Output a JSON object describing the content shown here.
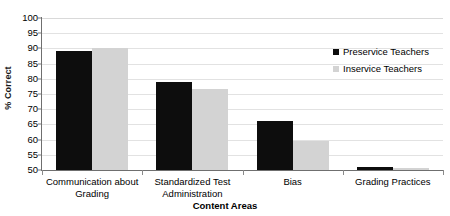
{
  "chart_data": {
    "type": "bar",
    "title": "",
    "xlabel": "Content Areas",
    "ylabel": "% Correct",
    "ylim": [
      50,
      100
    ],
    "ytick_step": 5,
    "yticks": [
      100,
      95,
      90,
      85,
      80,
      75,
      70,
      65,
      60,
      55,
      50
    ],
    "grid": true,
    "legend_position": "inside-top-right",
    "categories": [
      "Communication about Grading",
      "Standardized Test Administration",
      "Bias",
      "Grading Practices"
    ],
    "series": [
      {
        "name": "Preservice Teachers",
        "color": "#0d0d0d",
        "values": [
          89,
          79,
          66,
          51
        ]
      },
      {
        "name": "Inservice Teachers",
        "color": "#d3d3d3",
        "values": [
          90,
          76.5,
          59.5,
          50.8
        ]
      }
    ]
  },
  "legend": {
    "items": [
      {
        "label": "Preservice Teachers",
        "swatch": "black-square-icon"
      },
      {
        "label": "Inservice Teachers",
        "swatch": "gray-square-icon"
      }
    ]
  },
  "axes": {
    "y_title": "% Correct",
    "x_title": "Content Areas",
    "y_tick_labels": [
      "100",
      "95",
      "90",
      "85",
      "80",
      "75",
      "70",
      "65",
      "60",
      "55",
      "50"
    ],
    "x_tick_labels": [
      "Communication about Grading",
      "Standardized Test Administration",
      "Bias",
      "Grading Practices"
    ]
  },
  "colors": {
    "series_0": "#0d0d0d",
    "series_1": "#d3d3d3",
    "gridline": "#e2e2e2",
    "axis": "#6f6f6f",
    "background": "#ffffff"
  }
}
